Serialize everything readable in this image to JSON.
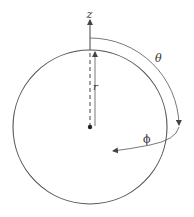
{
  "diagram": {
    "labels": {
      "z_axis": "z",
      "radius": "r",
      "polar_angle": "θ",
      "azimuthal_angle": "ϕ"
    },
    "colors": {
      "stroke": "#555555",
      "text": "#333333",
      "background": "#ffffff"
    },
    "sphere": {
      "cx": 90,
      "cy": 127,
      "r": 77
    }
  }
}
